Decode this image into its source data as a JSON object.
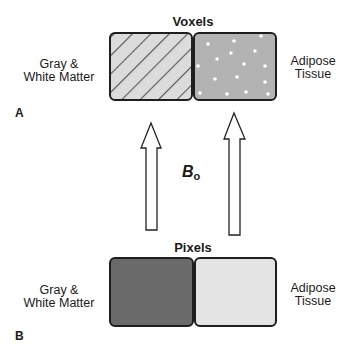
{
  "panel_a": {
    "letter": "A",
    "title": "Voxels",
    "left_label": [
      "Gray &",
      "White Matter"
    ],
    "right_label": [
      "Adipose",
      "Tissue"
    ],
    "left_fill": "#dcdcdc",
    "left_stripe_color": "#555555",
    "right_fill": "#b3b3b3",
    "dot_color": "#ffffff"
  },
  "field": {
    "symbol": "B",
    "subscript": "o"
  },
  "panel_b": {
    "letter": "B",
    "title": "Pixels",
    "left_label": [
      "Gray &",
      "White Matter"
    ],
    "right_label": [
      "Adipose",
      "Tissue"
    ],
    "left_fill": "#6a6a6a",
    "right_fill": "#e4e4e4"
  },
  "colors": {
    "border": "#1e1e1e",
    "arrow_fill": "#ffffff",
    "arrow_stroke": "#222222"
  }
}
